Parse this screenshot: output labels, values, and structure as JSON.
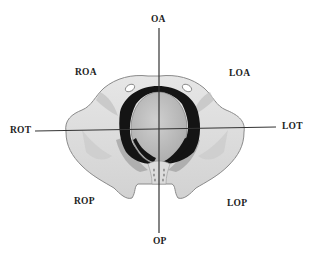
{
  "diagram": {
    "type": "pelvic-outlet-fetal-head-positions",
    "labels": {
      "top": "OA",
      "bottom": "OP",
      "left": "ROT",
      "right": "LOT",
      "upper_left": "ROA",
      "upper_right": "LOA",
      "lower_left": "ROP",
      "lower_right": "LOP"
    },
    "colors": {
      "background": "#ffffff",
      "bone_fill": "#d9d9d9",
      "bone_stroke": "#8a8a8a",
      "inlet_ring": "#141414",
      "head_fill": "#b9b9b9",
      "axis_line": "#333333",
      "label_text": "#222222"
    }
  }
}
